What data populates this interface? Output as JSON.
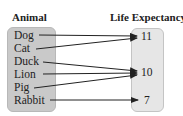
{
  "diagram": {
    "type": "mapping",
    "domain_header": "Animal",
    "range_header": "Life Expectancy",
    "domain": [
      "Dog",
      "Cat",
      "Duck",
      "Lion",
      "Pig",
      "Rabbit"
    ],
    "range": [
      "11",
      "10",
      "7"
    ],
    "mappings": [
      {
        "from": "Dog",
        "to": "11"
      },
      {
        "from": "Cat",
        "to": "11"
      },
      {
        "from": "Duck",
        "to": "10"
      },
      {
        "from": "Lion",
        "to": "10"
      },
      {
        "from": "Pig",
        "to": "10"
      },
      {
        "from": "Rabbit",
        "to": "7"
      }
    ],
    "colors": {
      "domain_box": "#c9c9c9",
      "range_box": "#e6e6e6",
      "arrow": "#222222"
    }
  }
}
